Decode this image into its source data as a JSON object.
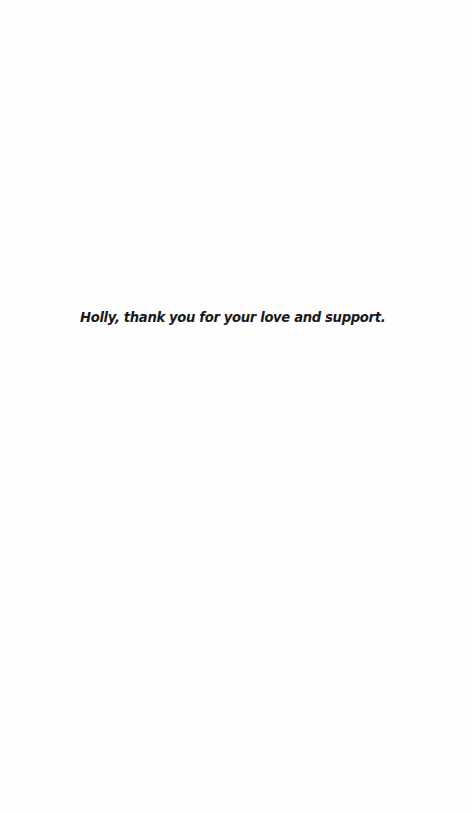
{
  "page": {
    "dedication": "Holly, thank you for your love and support."
  },
  "colors": {
    "background": "#fefefe",
    "text": "#1a1a1a"
  }
}
